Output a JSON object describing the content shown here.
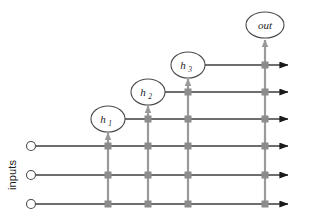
{
  "figure": {
    "kind": "neural-network-bus-diagram",
    "background_color": "#ffffff",
    "width": 310,
    "height": 219
  },
  "labels": {
    "inputs": "inputs",
    "output_node": "out",
    "hidden_1_base": "h",
    "hidden_1_sub": "1",
    "hidden_2_base": "h",
    "hidden_2_sub": "2",
    "hidden_3_base": "h",
    "hidden_3_sub": "3"
  },
  "colors": {
    "wire_horizontal": "#3d3d3d",
    "wire_vertical": "#9a9a9a",
    "junction": "#8c8c8c",
    "node_stroke": "#4a4a4a",
    "node_fill": "#ffffff",
    "arrow_dark": "#1a1a1a",
    "arrow_gray": "#9a9a9a",
    "text": "#262626"
  },
  "geometry": {
    "rows_y": [
      65,
      92,
      119,
      146,
      175,
      204
    ],
    "columns_x": [
      108,
      148,
      188,
      265
    ],
    "input_circle_x": 31,
    "input_circle_r": 4.5,
    "line_right_end": 288,
    "arrow_tip_x": 296
  },
  "nodes": [
    {
      "id": "h1",
      "base": "h",
      "sub": "1",
      "cx": 108,
      "cy": 119,
      "rx": 17,
      "ry": 13
    },
    {
      "id": "h2",
      "base": "h",
      "sub": "2",
      "cx": 148,
      "cy": 92,
      "rx": 17,
      "ry": 13
    },
    {
      "id": "h3",
      "base": "h",
      "sub": "3",
      "cx": 188,
      "cy": 65,
      "rx": 17,
      "ry": 13
    },
    {
      "id": "out",
      "base": "out",
      "sub": "",
      "cx": 265,
      "cy": 25,
      "rx": 19,
      "ry": 13
    }
  ],
  "input_terminals": [
    {
      "index": 1,
      "cx": 31,
      "cy": 146
    },
    {
      "index": 2,
      "cx": 31,
      "cy": 175
    },
    {
      "index": 3,
      "cx": 31,
      "cy": 204
    }
  ],
  "horizontal_wires": [
    {
      "row": 1,
      "y": 65,
      "x_start": 205,
      "x_end": 288,
      "source": "h3"
    },
    {
      "row": 2,
      "y": 92,
      "x_start": 165,
      "x_end": 288,
      "source": "h2"
    },
    {
      "row": 3,
      "y": 119,
      "x_start": 125,
      "x_end": 288,
      "source": "h1"
    },
    {
      "row": 4,
      "y": 146,
      "x_start": 36,
      "x_end": 288,
      "source": "input-1"
    },
    {
      "row": 5,
      "y": 175,
      "x_start": 36,
      "x_end": 288,
      "source": "input-2"
    },
    {
      "row": 6,
      "y": 204,
      "x_start": 36,
      "x_end": 288,
      "source": "input-3"
    }
  ],
  "vertical_wires": [
    {
      "column": 1,
      "x": 108,
      "y_bottom": 204,
      "y_top": 133,
      "target": "h1"
    },
    {
      "column": 2,
      "x": 148,
      "y_bottom": 204,
      "y_top": 106,
      "target": "h2"
    },
    {
      "column": 3,
      "x": 188,
      "y_bottom": 204,
      "y_top": 79,
      "target": "h3"
    },
    {
      "column": 4,
      "x": 265,
      "y_bottom": 204,
      "y_top": 39,
      "target": "out"
    }
  ],
  "junctions": [
    {
      "x": 108,
      "y": 146
    },
    {
      "x": 108,
      "y": 175
    },
    {
      "x": 108,
      "y": 204
    },
    {
      "x": 148,
      "y": 119
    },
    {
      "x": 148,
      "y": 146
    },
    {
      "x": 148,
      "y": 175
    },
    {
      "x": 148,
      "y": 204
    },
    {
      "x": 188,
      "y": 92
    },
    {
      "x": 188,
      "y": 119
    },
    {
      "x": 188,
      "y": 146
    },
    {
      "x": 188,
      "y": 175
    },
    {
      "x": 188,
      "y": 204
    },
    {
      "x": 265,
      "y": 65
    },
    {
      "x": 265,
      "y": 92
    },
    {
      "x": 265,
      "y": 119
    },
    {
      "x": 265,
      "y": 146
    },
    {
      "x": 265,
      "y": 175
    },
    {
      "x": 265,
      "y": 204
    }
  ]
}
